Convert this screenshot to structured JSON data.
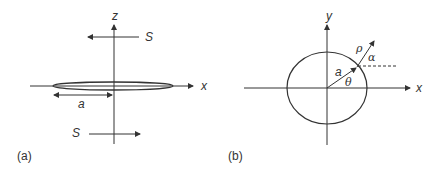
{
  "panels": [
    {
      "caption": "(a)",
      "axes": {
        "horizontal": "x",
        "vertical": "z"
      },
      "labels": {
        "top_arrow": "S",
        "bottom_arrow": "S",
        "radius": "a"
      },
      "description": "Thin disk of radius a in the x-plane with opposing S arrows above and below"
    },
    {
      "caption": "(b)",
      "axes": {
        "horizontal": "x",
        "vertical": "y"
      },
      "labels": {
        "radius": "a",
        "angle_theta": "θ",
        "distance_rho": "ρ",
        "angle_alpha": "α"
      },
      "description": "Circle of radius a with point at angle θ and outward vector ρ at angle α"
    }
  ],
  "colors": {
    "stroke": "#333333",
    "background": "#ffffff"
  }
}
